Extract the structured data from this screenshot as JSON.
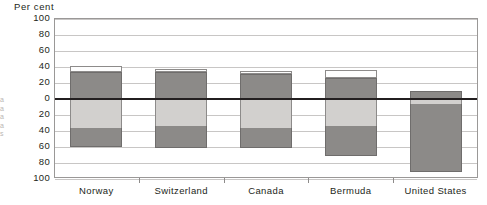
{
  "chart_data": {
    "type": "bar",
    "title": "",
    "ylabel": "Per cent",
    "xlabel": "",
    "ylim": [
      -100,
      100
    ],
    "grid": true,
    "legend_position": "none",
    "stacked": true,
    "diverging": true,
    "categories": [
      "Norway",
      "Switzerland",
      "Canada",
      "Bermuda",
      "United States"
    ],
    "y_tick_labels": [
      "100",
      "80",
      "60",
      "40",
      "20",
      "0",
      "20",
      "40",
      "60",
      "80",
      "100"
    ],
    "y_tick_values": [
      100,
      80,
      60,
      40,
      20,
      0,
      -20,
      -40,
      -60,
      -80,
      -100
    ],
    "series": [
      {
        "name": "top-white",
        "fill": "#fdfdfd",
        "values": [
          {
            "from": 33,
            "to": 40
          },
          {
            "from": 32,
            "to": 36
          },
          {
            "from": 30,
            "to": 34
          },
          {
            "from": 25,
            "to": 35
          },
          {
            "from": 9,
            "to": 9
          }
        ]
      },
      {
        "name": "upper-dark",
        "fill": "#8c8a88",
        "values": [
          {
            "from": 0,
            "to": 33
          },
          {
            "from": 0,
            "to": 32
          },
          {
            "from": 0,
            "to": 30
          },
          {
            "from": 0,
            "to": 25
          },
          {
            "from": 0,
            "to": 9
          }
        ]
      },
      {
        "name": "lower-light",
        "fill": "#d2d0ce",
        "values": [
          {
            "from": -37,
            "to": 0
          },
          {
            "from": -35,
            "to": 0
          },
          {
            "from": -38,
            "to": 0
          },
          {
            "from": -35,
            "to": 0
          },
          {
            "from": -8,
            "to": 0
          }
        ]
      },
      {
        "name": "bottom-dark",
        "fill": "#8c8a88",
        "values": [
          {
            "from": -61,
            "to": -37
          },
          {
            "from": -63,
            "to": -35
          },
          {
            "from": -62,
            "to": -38
          },
          {
            "from": -72,
            "to": -35
          },
          {
            "from": -92,
            "to": -8
          }
        ]
      }
    ],
    "colors": {
      "white_segment": "#fdfdfd",
      "light_gray_segment": "#d2d0ce",
      "dark_gray_segment": "#8c8a88",
      "zero_line": "#231f20",
      "gridline": "#c8c6c5",
      "frame": "#9a9897",
      "text": "#231f20"
    }
  },
  "edge_artifact": {
    "lines": [
      "a",
      "a",
      "a",
      "a",
      "s"
    ]
  }
}
